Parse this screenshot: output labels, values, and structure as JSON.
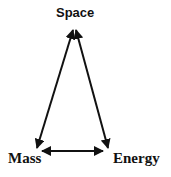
{
  "diagram": {
    "type": "triangle-relation",
    "nodes": [
      {
        "id": "space",
        "label": "Space"
      },
      {
        "id": "mass",
        "label": "Mass"
      },
      {
        "id": "energy",
        "label": "Energy"
      }
    ],
    "edges": [
      {
        "from": "space",
        "to": "mass",
        "direction": "bidirectional"
      },
      {
        "from": "space",
        "to": "energy",
        "direction": "bidirectional"
      },
      {
        "from": "mass",
        "to": "energy",
        "direction": "bidirectional"
      }
    ],
    "colors": {
      "stroke": "#111111",
      "background": "#ffffff"
    }
  }
}
